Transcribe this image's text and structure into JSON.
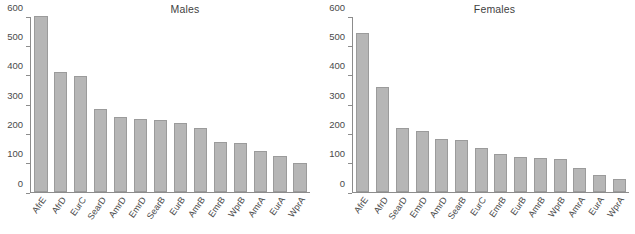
{
  "chart_data": [
    {
      "type": "bar",
      "title": "Males",
      "xlabel": "",
      "ylabel": "",
      "ylim": [
        0,
        600
      ],
      "yticks": [
        0,
        100,
        200,
        300,
        400,
        500,
        600
      ],
      "grid": false,
      "legend": "none",
      "categories": [
        "AfrE",
        "AfrD",
        "EurC",
        "SearD",
        "AmrD",
        "EmrD",
        "SearB",
        "EurB",
        "AmrB",
        "EmrB",
        "WprB",
        "AmrA",
        "EurA",
        "WprA"
      ],
      "values": [
        603,
        413,
        398,
        286,
        256,
        252,
        247,
        235,
        220,
        171,
        169,
        141,
        123,
        98
      ]
    },
    {
      "type": "bar",
      "title": "Females",
      "xlabel": "",
      "ylabel": "",
      "ylim": [
        0,
        600
      ],
      "yticks": [
        0,
        100,
        200,
        300,
        400,
        500,
        600
      ],
      "grid": false,
      "legend": "none",
      "categories": [
        "AfrE",
        "AfrD",
        "SearD",
        "EmrD",
        "AmrD",
        "SearB",
        "EurC",
        "EmrB",
        "EurB",
        "AmrB",
        "WprB",
        "AmrA",
        "EurA",
        "WprA"
      ],
      "values": [
        545,
        361,
        220,
        209,
        182,
        179,
        150,
        129,
        119,
        115,
        112,
        81,
        60,
        46
      ]
    }
  ],
  "colors": {
    "bar_fill": "#b6b6b6",
    "bar_border": "#9b9b9b",
    "axis": "#8c8c8c",
    "text": "#4a4a4a",
    "background": "#ffffff"
  }
}
